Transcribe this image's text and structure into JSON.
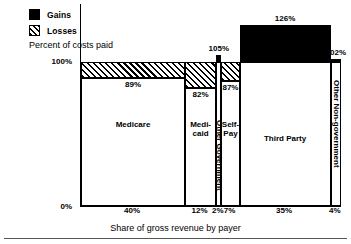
{
  "legend": {
    "gains_label": "Gains",
    "losses_label": "Losses",
    "note": "Percent of costs paid",
    "gains_color": "#000000",
    "losses_pattern": "diagonal-hatch"
  },
  "axes": {
    "y_top_label": "100%",
    "y_bottom_label": "0%",
    "x_title": "Share of gross revenue by payer",
    "y_max": 130,
    "y_min": 0,
    "reference_line": 100
  },
  "chart_data": {
    "type": "bar",
    "title": "",
    "subtitle": "Percent of costs paid",
    "xlabel": "Share of gross revenue by payer",
    "ylabel": "",
    "ylim": [
      0,
      130
    ],
    "grid": false,
    "legend_position": "top-left",
    "categories": [
      "Medicare",
      "Medi-\ncaid",
      "Other Government",
      "Self-\nPay",
      "Third Party",
      "Other Non-government"
    ],
    "widths": [
      40,
      12,
      2,
      7,
      35,
      4
    ],
    "width_labels": [
      "40%",
      "12%",
      "2%",
      "7%",
      "35%",
      "4%"
    ],
    "values": [
      89,
      82,
      105,
      87,
      126,
      102
    ],
    "value_labels": [
      "89%",
      "82%",
      "105%",
      "87%",
      "126%",
      "102%"
    ],
    "series": [
      {
        "name": "Percent of costs paid",
        "values": [
          89,
          82,
          105,
          87,
          126,
          102
        ]
      }
    ],
    "bars": [
      {
        "label": "Medicare",
        "label_display": "Medicare",
        "width_pct": 40,
        "width_label": "40%",
        "value": 89,
        "value_label": "89%",
        "type": "loss",
        "label_orientation": "horizontal"
      },
      {
        "label": "Medicaid",
        "label_display": "Medi-\ncaid",
        "width_pct": 12,
        "width_label": "12%",
        "value": 82,
        "value_label": "82%",
        "type": "loss",
        "label_orientation": "horizontal"
      },
      {
        "label": "Other Government",
        "label_display": "Other Government",
        "width_pct": 2,
        "width_label": "2%",
        "value": 105,
        "value_label": "105%",
        "type": "gain",
        "label_orientation": "vertical"
      },
      {
        "label": "Self-Pay",
        "label_display": "Self-\nPay",
        "width_pct": 7,
        "width_label": "7%",
        "value": 87,
        "value_label": "87%",
        "type": "loss",
        "label_orientation": "horizontal"
      },
      {
        "label": "Third Party",
        "label_display": "Third Party",
        "width_pct": 35,
        "width_label": "35%",
        "value": 126,
        "value_label": "126%",
        "type": "gain",
        "label_orientation": "horizontal"
      },
      {
        "label": "Other Non-government",
        "label_display": "Other Non-government",
        "width_pct": 4,
        "width_label": "4%",
        "value": 102,
        "value_label": "102%",
        "type": "gain",
        "label_orientation": "vertical"
      }
    ]
  }
}
